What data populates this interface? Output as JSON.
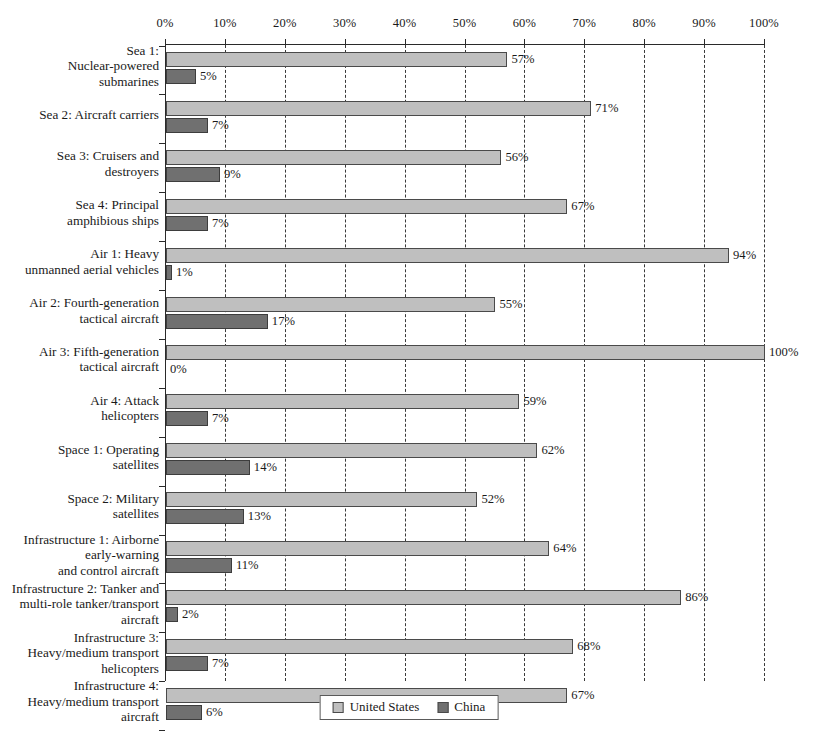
{
  "chart_data": {
    "type": "bar",
    "orientation": "horizontal",
    "title": "",
    "xlabel": "",
    "ylabel": "",
    "xlim": [
      0,
      100
    ],
    "xtick_labels": [
      "0%",
      "10%",
      "20%",
      "30%",
      "40%",
      "50%",
      "60%",
      "70%",
      "80%",
      "90%",
      "100%"
    ],
    "xticks": [
      0,
      10,
      20,
      30,
      40,
      50,
      60,
      70,
      80,
      90,
      100
    ],
    "grid": "vertical-dashed",
    "legend_position": "bottom-center",
    "categories": [
      "Sea 1:\nNuclear-powered\nsubmarines",
      "Sea 2: Aircraft carriers",
      "Sea 3: Cruisers and\ndestroyers",
      "Sea 4: Principal\namphibious ships",
      "Air 1: Heavy\nunmanned aerial vehicles",
      "Air 2: Fourth-generation\ntactical aircraft",
      "Air 3: Fifth-generation\ntactical aircraft",
      "Air 4: Attack\nhelicopters",
      "Space 1: Operating\nsatellites",
      "Space 2: Military\nsatellites",
      "Infrastructure 1: Airborne\nearly-warning\nand control aircraft",
      "Infrastructure 2: Tanker and\nmulti-role tanker/transport\naircraft",
      "Infrastructure 3:\nHeavy/medium transport\nhelicopters",
      "Infrastructure 4:\nHeavy/medium transport\naircraft"
    ],
    "series": [
      {
        "name": "United States",
        "color": "#bfbfbf",
        "values": [
          57,
          71,
          56,
          67,
          94,
          55,
          100,
          59,
          62,
          52,
          64,
          86,
          68,
          67
        ],
        "value_labels": [
          "57%",
          "71%",
          "56%",
          "67%",
          "94%",
          "55%",
          "100%",
          "59%",
          "62%",
          "52%",
          "64%",
          "86%",
          "68%",
          "67%"
        ]
      },
      {
        "name": "China",
        "color": "#707070",
        "values": [
          5,
          7,
          9,
          7,
          1,
          17,
          0,
          7,
          14,
          13,
          11,
          2,
          7,
          6
        ],
        "value_labels": [
          "5%",
          "7%",
          "9%",
          "7%",
          "1%",
          "17%",
          "0%",
          "7%",
          "14%",
          "13%",
          "11%",
          "2%",
          "7%",
          "6%"
        ]
      }
    ]
  },
  "legend": {
    "items": [
      {
        "label": "United States",
        "swatch": "us"
      },
      {
        "label": "China",
        "swatch": "cn"
      }
    ]
  }
}
